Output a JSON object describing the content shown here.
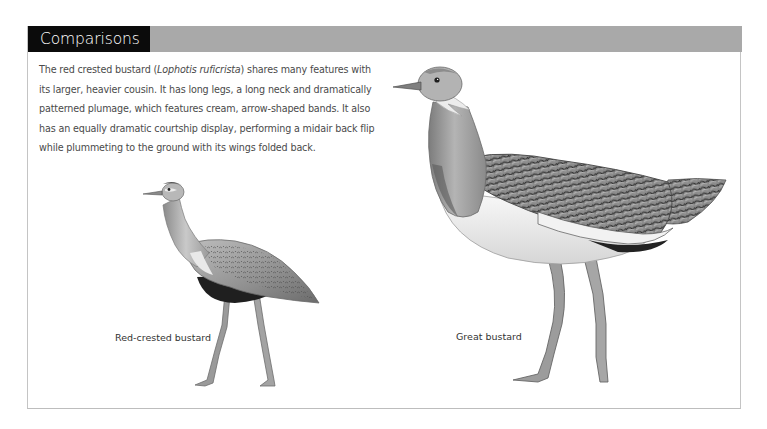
{
  "section": {
    "title": "Comparisons",
    "header_colors": {
      "title_background": "#0b0b0b",
      "bar_background": "#a9a9a9",
      "title_text": "#ffffff"
    }
  },
  "intro": {
    "part1": "The red crested bustard (",
    "species_latin": "Lophotis ruficrista",
    "part2": ") shares many features with its larger, heavier cousin. It has long legs, a long neck and dramatically patterned plumage, which features cream, arrow-shaped bands. It also has an equally dramatic courtship display, performing a midair back flip while plummeting to the ground with its wings folded back."
  },
  "illustrations": [
    {
      "id": "red-crested-bustard",
      "caption": "Red-crested bustard",
      "image": "pencil-illustration-red-crested-bustard"
    },
    {
      "id": "great-bustard",
      "caption": "Great bustard",
      "image": "pencil-illustration-great-bustard"
    }
  ]
}
